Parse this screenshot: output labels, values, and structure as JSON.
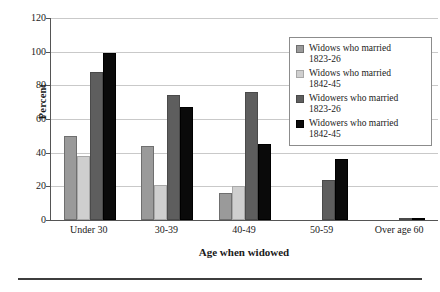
{
  "chart_data": {
    "type": "bar",
    "title": "",
    "xlabel": "Age when widowed",
    "ylabel": "Percent",
    "ylim": [
      0,
      120
    ],
    "yticks": [
      0,
      20,
      40,
      60,
      80,
      100,
      120
    ],
    "grid": true,
    "legend_position": "top-right inside plot",
    "categories": [
      "Under 30",
      "30-39",
      "40-49",
      "50-59",
      "Over age 60"
    ],
    "series": [
      {
        "name": "Widows who married 1823-26",
        "color": "#9a9a9a",
        "values": [
          50,
          44,
          16,
          null,
          null
        ]
      },
      {
        "name": "Widows who married 1842-45",
        "color": "#cfcfcf",
        "values": [
          38,
          21,
          20,
          null,
          null
        ]
      },
      {
        "name": "Widowers who married 1823-26",
        "color": "#5e5e5e",
        "values": [
          88,
          74,
          76,
          24,
          1
        ]
      },
      {
        "name": "Widowers who married 1842-45",
        "color": "#0a0a0a",
        "values": [
          99,
          67,
          45,
          36,
          1
        ]
      }
    ]
  },
  "legend": {
    "entries": [
      {
        "label_line1": "Widows who married",
        "label_line2": "1823-26"
      },
      {
        "label_line1": "Widows who married",
        "label_line2": "1842-45"
      },
      {
        "label_line1": "Widowers who married",
        "label_line2": "1823-26"
      },
      {
        "label_line1": "Widowers who married",
        "label_line2": "1842-45"
      }
    ]
  }
}
